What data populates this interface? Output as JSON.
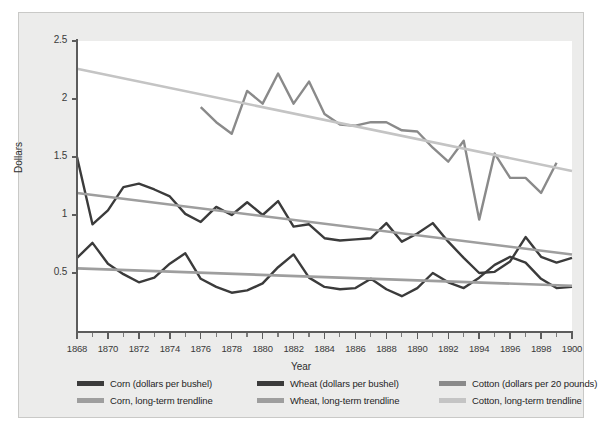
{
  "chart_data": {
    "type": "line",
    "title": "",
    "xlabel": "Year",
    "ylabel": "Dollars",
    "xlim": [
      1868,
      1900
    ],
    "ylim": [
      0,
      2.5
    ],
    "grid": false,
    "legend_position": "bottom",
    "x_tick_labels": [
      "1868",
      "1870",
      "1872",
      "1874",
      "1876",
      "1878",
      "1880",
      "1882",
      "1884",
      "1886",
      "1888",
      "1890",
      "1892",
      "1894",
      "1896",
      "1898",
      "1900"
    ],
    "x_tick_values": [
      1868,
      1870,
      1872,
      1874,
      1876,
      1878,
      1880,
      1882,
      1884,
      1886,
      1888,
      1890,
      1892,
      1894,
      1896,
      1898,
      1900
    ],
    "y_tick_labels": [
      "0.5",
      "1",
      "1.5",
      "2",
      "2.5"
    ],
    "y_tick_values": [
      0.5,
      1,
      1.5,
      2,
      2.5
    ],
    "series": [
      {
        "name": "Corn (dollars per bushel)",
        "color": "#3b3b3b",
        "kind": "data",
        "x": [
          1868,
          1869,
          1870,
          1871,
          1872,
          1873,
          1874,
          1875,
          1876,
          1877,
          1878,
          1879,
          1880,
          1881,
          1882,
          1883,
          1884,
          1885,
          1886,
          1887,
          1888,
          1889,
          1890,
          1891,
          1892,
          1893,
          1894,
          1895,
          1896,
          1897,
          1898,
          1899,
          1900
        ],
        "values": [
          0.63,
          0.76,
          0.58,
          0.49,
          0.42,
          0.46,
          0.58,
          0.67,
          0.45,
          0.38,
          0.33,
          0.35,
          0.41,
          0.55,
          0.66,
          0.46,
          0.38,
          0.36,
          0.37,
          0.45,
          0.36,
          0.3,
          0.37,
          0.5,
          0.42,
          0.37,
          0.46,
          0.57,
          0.64,
          0.59,
          0.45,
          0.37,
          0.38
        ]
      },
      {
        "name": "Wheat (dollars per bushel)",
        "color": "#3b3b3b",
        "kind": "data",
        "x": [
          1868,
          1869,
          1870,
          1871,
          1872,
          1873,
          1874,
          1875,
          1876,
          1877,
          1878,
          1879,
          1880,
          1881,
          1882,
          1883,
          1884,
          1885,
          1886,
          1887,
          1888,
          1889,
          1890,
          1891,
          1892,
          1893,
          1894,
          1895,
          1896,
          1897,
          1898,
          1899,
          1900
        ],
        "values": [
          1.5,
          0.92,
          1.04,
          1.24,
          1.27,
          1.22,
          1.16,
          1.01,
          0.94,
          1.07,
          1.0,
          1.11,
          1.0,
          1.12,
          0.9,
          0.92,
          0.8,
          0.78,
          0.79,
          0.8,
          0.93,
          0.77,
          0.84,
          0.93,
          0.77,
          0.63,
          0.5,
          0.51,
          0.6,
          0.81,
          0.64,
          0.59,
          0.63
        ]
      },
      {
        "name": "Cotton (dollars per 20 pounds)",
        "color": "#8a8a8a",
        "kind": "data",
        "x": [
          1876,
          1877,
          1878,
          1879,
          1880,
          1881,
          1882,
          1883,
          1884,
          1885,
          1886,
          1887,
          1888,
          1889,
          1890,
          1891,
          1892,
          1893,
          1894,
          1895,
          1896,
          1897,
          1898,
          1899
        ],
        "values": [
          1.93,
          1.8,
          1.7,
          2.07,
          1.96,
          2.22,
          1.96,
          2.15,
          1.87,
          1.78,
          1.77,
          1.8,
          1.8,
          1.73,
          1.72,
          1.58,
          1.46,
          1.64,
          0.96,
          1.53,
          1.32,
          1.32,
          1.19,
          1.45
        ]
      },
      {
        "name": "Corn, long-term trendline",
        "color": "#9e9e9e",
        "kind": "trend",
        "x": [
          1868,
          1900
        ],
        "values": [
          0.54,
          0.39
        ]
      },
      {
        "name": "Wheat, long-term trendline",
        "color": "#9e9e9e",
        "kind": "trend",
        "x": [
          1868,
          1900
        ],
        "values": [
          1.19,
          0.66
        ]
      },
      {
        "name": "Cotton, long-term trendline",
        "color": "#c4c4c4",
        "kind": "trend",
        "x": [
          1868,
          1900
        ],
        "values": [
          2.26,
          1.38
        ]
      }
    ]
  },
  "legend": {
    "columns": [
      {
        "rows": [
          {
            "label": "Corn (dollars per bushel)",
            "color": "#3b3b3b"
          },
          {
            "label": "Corn, long-term trendline",
            "color": "#9e9e9e"
          }
        ]
      },
      {
        "rows": [
          {
            "label": "Wheat (dollars per bushel)",
            "color": "#3b3b3b"
          },
          {
            "label": "Wheat, long-term trendline",
            "color": "#9e9e9e"
          }
        ]
      },
      {
        "rows": [
          {
            "label": "Cotton (dollars per 20 pounds)",
            "color": "#8a8a8a"
          },
          {
            "label": "Cotton, long-term trendline",
            "color": "#c4c4c4"
          }
        ]
      }
    ]
  }
}
